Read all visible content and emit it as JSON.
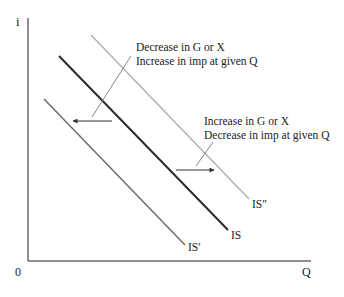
{
  "diagram": {
    "axes": {
      "y_label": "i",
      "x_label": "Q",
      "origin_label": "0"
    },
    "curves": [
      {
        "name": "IS",
        "label": "IS",
        "color": "#2a2a2a",
        "width": 2
      },
      {
        "name": "IS-prime",
        "label": "IS′",
        "color": "#707070",
        "width": 1.6
      },
      {
        "name": "IS-double-prime",
        "label": "IS″",
        "color": "#b0b0b0",
        "width": 1.6
      }
    ],
    "annotations": {
      "left_shift": {
        "line1": "Decrease in G or X",
        "line2": "Increase in imp at given Q",
        "direction": "left"
      },
      "right_shift": {
        "line1": "Increase in G or X",
        "line2": "Decrease in imp at given Q",
        "direction": "right"
      }
    }
  }
}
